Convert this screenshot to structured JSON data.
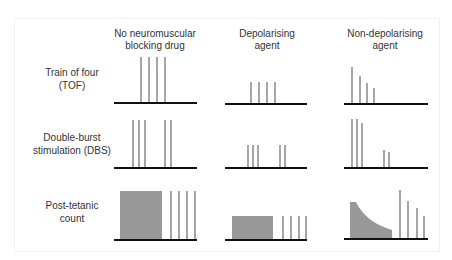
{
  "columns": [
    {
      "line1": "No neuromuscular",
      "line2": "blocking drug"
    },
    {
      "line1": "Depolarising",
      "line2": "agent"
    },
    {
      "line1": "Non-depolarising",
      "line2": "agent"
    }
  ],
  "rows": [
    {
      "line1": "Train of four",
      "line2": "(TOF)"
    },
    {
      "line1": "Double-burst",
      "line2": "stimulation (DBS)"
    },
    {
      "line1": "Post-tetanic",
      "line2": "count"
    }
  ],
  "colors": {
    "bar": "#a6a6a6",
    "fill": "#999999",
    "baseline": "#111111",
    "text": "#333333"
  },
  "diagrams": {
    "baselines": [
      {
        "row": 0,
        "col": 0,
        "x1": 114,
        "x2": 197,
        "y": 103
      },
      {
        "row": 0,
        "col": 1,
        "x1": 225,
        "x2": 307,
        "y": 104
      },
      {
        "row": 0,
        "col": 2,
        "x1": 344,
        "x2": 428,
        "y": 104
      },
      {
        "row": 1,
        "col": 0,
        "x1": 114,
        "x2": 197,
        "y": 168
      },
      {
        "row": 1,
        "col": 1,
        "x1": 225,
        "x2": 307,
        "y": 168
      },
      {
        "row": 1,
        "col": 2,
        "x1": 344,
        "x2": 428,
        "y": 168
      },
      {
        "row": 2,
        "col": 0,
        "x1": 114,
        "x2": 197,
        "y": 240
      },
      {
        "row": 2,
        "col": 1,
        "x1": 225,
        "x2": 307,
        "y": 240
      },
      {
        "row": 2,
        "col": 2,
        "x1": 344,
        "x2": 428,
        "y": 239
      }
    ],
    "bars": [
      {
        "x": 141,
        "top": 57,
        "bottom": 103
      },
      {
        "x": 149,
        "top": 57,
        "bottom": 103
      },
      {
        "x": 157,
        "top": 57,
        "bottom": 103
      },
      {
        "x": 165,
        "top": 57,
        "bottom": 103
      },
      {
        "x": 251,
        "top": 82,
        "bottom": 104
      },
      {
        "x": 259,
        "top": 82,
        "bottom": 104
      },
      {
        "x": 267,
        "top": 82,
        "bottom": 104
      },
      {
        "x": 275,
        "top": 82,
        "bottom": 104
      },
      {
        "x": 352,
        "top": 67,
        "bottom": 104
      },
      {
        "x": 360,
        "top": 76,
        "bottom": 104
      },
      {
        "x": 367,
        "top": 83,
        "bottom": 104
      },
      {
        "x": 374,
        "top": 88,
        "bottom": 104
      },
      {
        "x": 133,
        "top": 120,
        "bottom": 168
      },
      {
        "x": 139,
        "top": 120,
        "bottom": 168
      },
      {
        "x": 145,
        "top": 120,
        "bottom": 168
      },
      {
        "x": 165,
        "top": 120,
        "bottom": 168
      },
      {
        "x": 171,
        "top": 120,
        "bottom": 168
      },
      {
        "x": 248,
        "top": 145,
        "bottom": 168
      },
      {
        "x": 253,
        "top": 145,
        "bottom": 168
      },
      {
        "x": 258,
        "top": 145,
        "bottom": 168
      },
      {
        "x": 280,
        "top": 145,
        "bottom": 168
      },
      {
        "x": 285,
        "top": 145,
        "bottom": 168
      },
      {
        "x": 352,
        "top": 119,
        "bottom": 168
      },
      {
        "x": 357,
        "top": 119,
        "bottom": 168
      },
      {
        "x": 362,
        "top": 123,
        "bottom": 168
      },
      {
        "x": 384,
        "top": 150,
        "bottom": 168
      },
      {
        "x": 389,
        "top": 152,
        "bottom": 168
      },
      {
        "x": 171,
        "top": 191,
        "bottom": 240
      },
      {
        "x": 179,
        "top": 191,
        "bottom": 240
      },
      {
        "x": 187,
        "top": 191,
        "bottom": 240
      },
      {
        "x": 195,
        "top": 191,
        "bottom": 240
      },
      {
        "x": 283,
        "top": 216,
        "bottom": 240
      },
      {
        "x": 291,
        "top": 216,
        "bottom": 240
      },
      {
        "x": 299,
        "top": 216,
        "bottom": 240
      },
      {
        "x": 306,
        "top": 216,
        "bottom": 240
      },
      {
        "x": 400,
        "top": 190,
        "bottom": 239
      },
      {
        "x": 408,
        "top": 201,
        "bottom": 239
      },
      {
        "x": 417,
        "top": 208,
        "bottom": 239
      },
      {
        "x": 424,
        "top": 216,
        "bottom": 239
      }
    ],
    "tetanic_blocks": [
      {
        "x": 120,
        "y": 191,
        "w": 42,
        "h": 49
      },
      {
        "x": 232,
        "y": 216,
        "w": 41,
        "h": 24
      }
    ],
    "fade_curve": {
      "path": "M350,239 L350,202 L356,202 C362,214 372,224 392,230 L392,239 Z"
    }
  }
}
